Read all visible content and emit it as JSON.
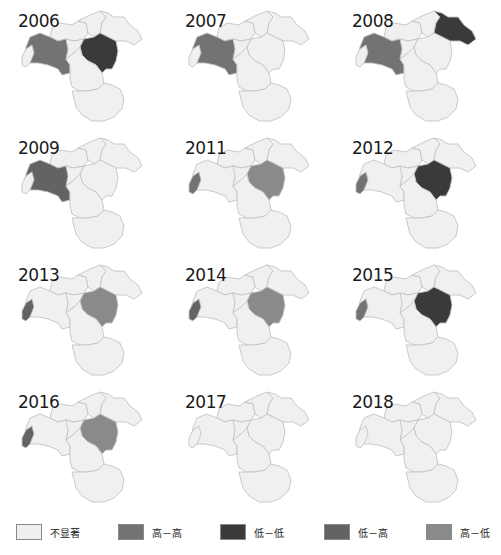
{
  "legend": [
    {
      "key": "ns",
      "label": "不显著",
      "color": "#efefef"
    },
    {
      "key": "hh",
      "label": "高－高",
      "color": "#737373"
    },
    {
      "key": "ll",
      "label": "低－低",
      "color": "#3a3a3a"
    },
    {
      "key": "lh",
      "label": "低－高",
      "color": "#636363"
    },
    {
      "key": "hl",
      "label": "高－低",
      "color": "#8a8a8a"
    }
  ],
  "panels": [
    {
      "year": "2006",
      "regions": {
        "D": "hh",
        "E": "ll"
      }
    },
    {
      "year": "2007",
      "regions": {
        "D": "hh"
      }
    },
    {
      "year": "2008",
      "regions": {
        "D": "hh",
        "C": "ll"
      }
    },
    {
      "year": "2009",
      "regions": {
        "D": "lh"
      }
    },
    {
      "year": "2011",
      "regions": {
        "F": "hh",
        "E": "hl"
      }
    },
    {
      "year": "2012",
      "regions": {
        "F": "hh",
        "E": "ll"
      }
    },
    {
      "year": "2013",
      "regions": {
        "F": "lh",
        "E": "hl"
      }
    },
    {
      "year": "2014",
      "regions": {
        "F": "lh",
        "E": "hl"
      }
    },
    {
      "year": "2015",
      "regions": {
        "F": "hh",
        "E": "ll"
      }
    },
    {
      "year": "2016",
      "regions": {
        "F": "lh",
        "E": "hl"
      }
    },
    {
      "year": "2017",
      "regions": {}
    },
    {
      "year": "2018",
      "regions": {}
    }
  ]
}
